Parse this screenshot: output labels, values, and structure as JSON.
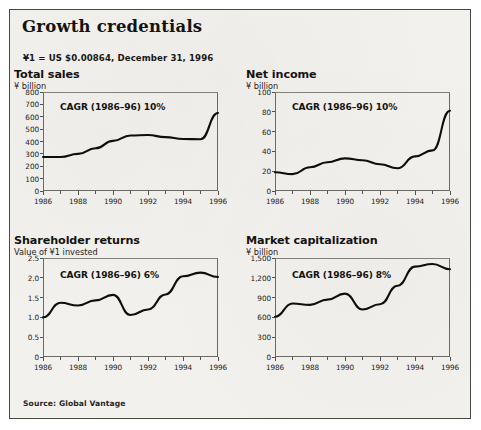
{
  "exhibit": {
    "title": "Growth credentials",
    "fx_note": "¥1 = US $0.00864, December 31, 1996",
    "source": "Source: Global Vantage",
    "frame_color": "#4a4845",
    "background_color": "#f2f1ee",
    "line_color": "#100e0b"
  },
  "chart_data": [
    {
      "id": "total-sales",
      "type": "line",
      "title": "Total sales",
      "subtitle": "¥ billion",
      "annotation": "CAGR (1986–96) 10%",
      "xlabel": "",
      "ylabel": "¥ billion",
      "grid": false,
      "legend": "none",
      "x": [
        1986,
        1987,
        1988,
        1989,
        1990,
        1991,
        1992,
        1993,
        1994,
        1995,
        1996
      ],
      "values": [
        275,
        275,
        300,
        345,
        405,
        448,
        452,
        435,
        420,
        418,
        630
      ],
      "ylim": [
        0,
        800
      ],
      "yticks": [
        0,
        100,
        200,
        300,
        400,
        500,
        600,
        700,
        800
      ],
      "ytick_labels": [
        "0",
        "100",
        "200",
        "300",
        "400",
        "500",
        "600",
        "700",
        "800"
      ],
      "xticks": [
        1986,
        1988,
        1990,
        1992,
        1994,
        1996
      ],
      "xtick_labels": [
        "1986",
        "1988",
        "1990",
        "1992",
        "1994",
        "1996"
      ]
    },
    {
      "id": "net-income",
      "type": "line",
      "title": "Net income",
      "subtitle": "¥ billion",
      "annotation": "CAGR (1986–96) 10%",
      "xlabel": "",
      "ylabel": "¥ billion",
      "grid": false,
      "legend": "none",
      "x": [
        1986,
        1987,
        1988,
        1989,
        1990,
        1991,
        1992,
        1993,
        1994,
        1995,
        1996
      ],
      "values": [
        19,
        17,
        24,
        29,
        33,
        31,
        27,
        23,
        35,
        41,
        81
      ],
      "ylim": [
        0,
        100
      ],
      "yticks": [
        0,
        20,
        40,
        60,
        80,
        100
      ],
      "ytick_labels": [
        "0",
        "20",
        "40",
        "60",
        "80",
        "100"
      ],
      "xticks": [
        1986,
        1988,
        1990,
        1992,
        1994,
        1996
      ],
      "xtick_labels": [
        "1986",
        "1988",
        "1990",
        "1992",
        "1994",
        "1996"
      ]
    },
    {
      "id": "shareholder-returns",
      "type": "line",
      "title": "Shareholder returns",
      "subtitle": "Value of ¥1 invested",
      "annotation": "CAGR (1986–96) 6%",
      "xlabel": "",
      "ylabel": "Value of ¥1 invested",
      "grid": false,
      "legend": "none",
      "x": [
        1986,
        1987,
        1988,
        1989,
        1990,
        1991,
        1992,
        1993,
        1994,
        1995,
        1996
      ],
      "values": [
        1.0,
        1.37,
        1.3,
        1.43,
        1.57,
        1.06,
        1.2,
        1.58,
        2.04,
        2.13,
        2.02
      ],
      "ylim": [
        0,
        2.5
      ],
      "yticks": [
        0,
        0.5,
        1.0,
        1.5,
        2.0,
        2.5
      ],
      "ytick_labels": [
        "0",
        "0.5",
        "1.0",
        "1.5",
        "2.0",
        "2.5"
      ],
      "xticks": [
        1986,
        1988,
        1990,
        1992,
        1994,
        1996
      ],
      "xtick_labels": [
        "1986",
        "1988",
        "1990",
        "1992",
        "1994",
        "1996"
      ]
    },
    {
      "id": "market-capitalization",
      "type": "line",
      "title": "Market capitalization",
      "subtitle": "¥ billion",
      "annotation": "CAGR (1986–96) 8%",
      "xlabel": "",
      "ylabel": "¥ billion",
      "grid": false,
      "legend": "none",
      "x": [
        1986,
        1987,
        1988,
        1989,
        1990,
        1991,
        1992,
        1993,
        1994,
        1995,
        1996
      ],
      "values": [
        610,
        810,
        790,
        870,
        960,
        720,
        800,
        1080,
        1370,
        1410,
        1330
      ],
      "ylim": [
        0,
        1500
      ],
      "yticks": [
        0,
        300,
        600,
        900,
        1200,
        1500
      ],
      "ytick_labels": [
        "0",
        "300",
        "600",
        "900",
        "1,200",
        "1,500"
      ],
      "xticks": [
        1986,
        1988,
        1990,
        1992,
        1994,
        1996
      ],
      "xtick_labels": [
        "1986",
        "1988",
        "1990",
        "1992",
        "1994",
        "1996"
      ]
    }
  ]
}
